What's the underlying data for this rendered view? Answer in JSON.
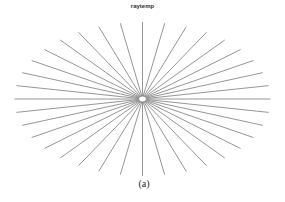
{
  "figure": {
    "title": "raytemp",
    "caption": "(a)",
    "ray_count": 36,
    "ray_color": "#8a8a8a",
    "center": [
      142.5,
      99
    ],
    "radius_x": 128,
    "radius_y": 77,
    "hub_radius_x": 4,
    "hub_radius_y": 3
  }
}
